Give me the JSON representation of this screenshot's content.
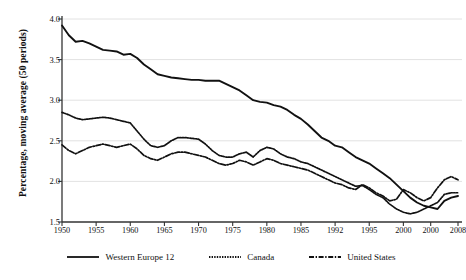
{
  "chart_data": {
    "type": "line",
    "title": "",
    "subtitle": "",
    "xlabel": "",
    "ylabel": "Percentage, moving average (50 periods)",
    "xlim": [
      1950,
      2008
    ],
    "ylim": [
      1.5,
      4.0
    ],
    "grid": true,
    "grid_axis": "y",
    "legend_position": "bottom-center",
    "y_ticks": [
      "1.5",
      "2.0",
      "2.5",
      "3.0",
      "3.5",
      "4.0"
    ],
    "y_tick_values": [
      1.5,
      2.0,
      2.5,
      3.0,
      3.5,
      4.0
    ],
    "x_ticks": [
      "1950",
      "1955",
      "1960",
      "1965",
      "1970",
      "1975",
      "1980",
      "1985",
      "1992",
      "1995",
      "2000",
      "2000",
      "2008"
    ],
    "x_tick_values": [
      1950,
      1955,
      1960,
      1965,
      1970,
      1975,
      1980,
      1985,
      1990,
      1995,
      2000,
      2004,
      2008
    ],
    "x": [
      1950,
      1951,
      1952,
      1953,
      1954,
      1955,
      1956,
      1957,
      1958,
      1959,
      1960,
      1961,
      1962,
      1963,
      1964,
      1965,
      1966,
      1967,
      1968,
      1969,
      1970,
      1971,
      1972,
      1973,
      1974,
      1975,
      1976,
      1977,
      1978,
      1979,
      1980,
      1981,
      1982,
      1983,
      1984,
      1985,
      1986,
      1987,
      1988,
      1989,
      1990,
      1991,
      1992,
      1993,
      1994,
      1995,
      1996,
      1997,
      1998,
      1999,
      2000,
      2001,
      2002,
      2003,
      2004,
      2005,
      2006,
      2007,
      2008
    ],
    "series": [
      {
        "name": "Western Europe 12",
        "style": "solid",
        "color": "#111111",
        "values": [
          3.92,
          3.8,
          3.72,
          3.73,
          3.7,
          3.66,
          3.62,
          3.61,
          3.6,
          3.56,
          3.57,
          3.52,
          3.44,
          3.38,
          3.32,
          3.3,
          3.28,
          3.27,
          3.26,
          3.25,
          3.25,
          3.24,
          3.24,
          3.24,
          3.2,
          3.16,
          3.12,
          3.06,
          3.0,
          2.98,
          2.97,
          2.94,
          2.92,
          2.88,
          2.82,
          2.77,
          2.7,
          2.62,
          2.54,
          2.5,
          2.44,
          2.42,
          2.36,
          2.3,
          2.26,
          2.22,
          2.16,
          2.1,
          2.04,
          1.96,
          1.88,
          1.8,
          1.74,
          1.7,
          1.68,
          1.66,
          1.76,
          1.8,
          1.82
        ]
      },
      {
        "name": "Canada",
        "style": "dotted",
        "color": "#111111",
        "values": [
          2.85,
          2.82,
          2.78,
          2.76,
          2.77,
          2.78,
          2.79,
          2.78,
          2.76,
          2.74,
          2.72,
          2.62,
          2.52,
          2.44,
          2.42,
          2.44,
          2.5,
          2.54,
          2.54,
          2.53,
          2.52,
          2.46,
          2.38,
          2.32,
          2.3,
          2.3,
          2.34,
          2.36,
          2.3,
          2.38,
          2.42,
          2.4,
          2.34,
          2.3,
          2.28,
          2.24,
          2.22,
          2.18,
          2.14,
          2.1,
          2.06,
          2.02,
          1.98,
          1.94,
          1.95,
          1.9,
          1.84,
          1.8,
          1.72,
          1.66,
          1.62,
          1.6,
          1.62,
          1.66,
          1.7,
          1.74,
          1.84,
          1.86,
          1.86
        ]
      },
      {
        "name": "United States",
        "style": "dashdot",
        "color": "#111111",
        "values": [
          2.45,
          2.38,
          2.34,
          2.38,
          2.42,
          2.44,
          2.46,
          2.44,
          2.42,
          2.44,
          2.46,
          2.4,
          2.32,
          2.28,
          2.26,
          2.3,
          2.34,
          2.36,
          2.36,
          2.34,
          2.32,
          2.3,
          2.26,
          2.22,
          2.2,
          2.22,
          2.26,
          2.24,
          2.2,
          2.24,
          2.28,
          2.26,
          2.22,
          2.2,
          2.18,
          2.16,
          2.14,
          2.1,
          2.06,
          2.02,
          1.98,
          1.96,
          1.92,
          1.9,
          1.96,
          1.92,
          1.86,
          1.82,
          1.76,
          1.78,
          1.9,
          1.86,
          1.8,
          1.76,
          1.8,
          1.92,
          2.02,
          2.06,
          2.02
        ]
      }
    ]
  },
  "legend": {
    "items": [
      {
        "label": "Western Europe 12"
      },
      {
        "label": "Canada"
      },
      {
        "label": "United States"
      }
    ]
  }
}
